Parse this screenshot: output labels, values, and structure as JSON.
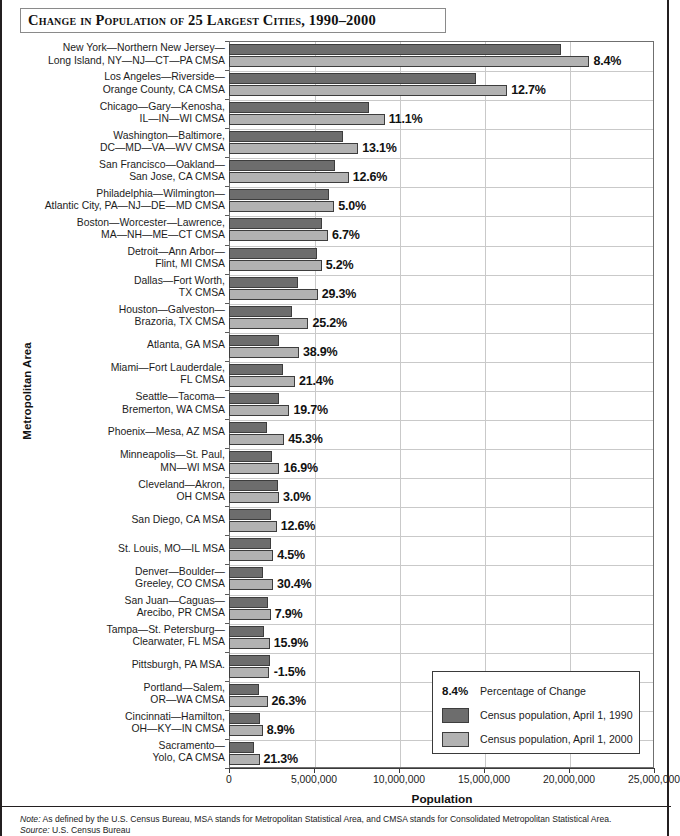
{
  "title": "Change in Population of 25 Largest Cities, 1990–2000",
  "axes": {
    "y_title": "Metropolitan Area",
    "x_title": "Population",
    "x_ticks": [
      "0",
      "5,000,000",
      "10,000,000",
      "15,000,000",
      "20,000,000",
      "25,000,000"
    ]
  },
  "legend": {
    "pct_key": "8.4%",
    "pct_label": "Percentage of Change",
    "series_1990": "Census population, April 1, 1990",
    "series_2000": "Census population, April 1, 2000"
  },
  "notes": {
    "note_prefix": "Note:",
    "note_text": " As defined by the U.S. Census Bureau, MSA stands for Metropolitan Statistical Area, and CMSA stands for Consolidated Metropolitan Statistical Area.",
    "source_prefix": "Source:",
    "source_text": " U.S. Census Bureau"
  },
  "colors": {
    "bar_1990": "#6d6d6d",
    "bar_2000": "#b2b2b2",
    "grid": "#c9c9c9",
    "frame": "#6f6f6f",
    "text": "#1c1c1c"
  },
  "chart_data": {
    "type": "bar",
    "title": "Change in Population of 25 Largest Cities, 1990–2000",
    "xlabel": "Population",
    "ylabel": "Metropolitan Area",
    "orientation": "horizontal",
    "grid": true,
    "legend_position": "inside-bottom-right",
    "xlim": [
      0,
      25000000
    ],
    "xticks": [
      0,
      5000000,
      10000000,
      15000000,
      20000000,
      25000000
    ],
    "categories": [
      "New York—Northern New Jersey—\nLong Island, NY—NJ—CT—PA CMSA",
      "Los Angeles—Riverside—\nOrange County, CA CMSA",
      "Chicago—Gary—Kenosha,\nIL—IN—WI CMSA",
      "Washington—Baltimore,\nDC—MD—VA—WV CMSA",
      "San Francisco—Oakland—\nSan Jose, CA CMSA",
      "Philadelphia—Wilmington—\nAtlantic City, PA—NJ—DE—MD CMSA",
      "Boston—Worcester—Lawrence,\nMA—NH—ME—CT CMSA",
      "Detroit—Ann Arbor—\nFlint, MI CMSA",
      "Dallas—Fort Worth,\nTX CMSA",
      "Houston—Galveston—\nBrazoria, TX CMSA",
      "Atlanta, GA MSA",
      "Miami—Fort Lauderdale,\nFL CMSA",
      "Seattle—Tacoma—\nBremerton, WA CMSA",
      "Phoenix—Mesa, AZ MSA",
      "Minneapolis—St. Paul,\nMN—WI MSA",
      "Cleveland—Akron,\nOH CMSA",
      "San Diego, CA MSA",
      "St. Louis, MO—IL MSA",
      "Denver—Boulder—\nGreeley, CO CMSA",
      "San Juan—Caguas—\nArecibo, PR CMSA",
      "Tampa—St. Petersburg—\nClearwater, FL MSA",
      "Pittsburgh, PA MSA.",
      "Portland—Salem,\nOR—WA CMSA",
      "Cincinnati—Hamilton,\nOH—KY—IN CMSA",
      "Sacramento—\nYolo, CA CMSA"
    ],
    "series": [
      {
        "name": "Census population, April 1, 1990",
        "color": "#6d6d6d",
        "values": [
          19549649,
          14531529,
          8239820,
          6727050,
          6253311,
          5892937,
          5455403,
          5187171,
          4037282,
          3731131,
          2959950,
          3192582,
          2970328,
          2238480,
          2538834,
          2859644,
          2498016,
          2492525,
          1980140,
          2270808,
          2067959,
          2394811,
          1793476,
          1817571,
          1481102
        ]
      },
      {
        "name": "Census population, April 1, 2000",
        "color": "#b2b2b2",
        "values": [
          21199865,
          16373645,
          9157540,
          7608070,
          7039362,
          6188463,
          5819100,
          5456428,
          5221801,
          4669571,
          4112198,
          3876380,
          3554760,
          3251876,
          2968806,
          2945831,
          2813833,
          2603607,
          2581506,
          2450292,
          2395997,
          2358695,
          2265223,
          1979202,
          1796857
        ]
      }
    ],
    "percentage_change_labels": [
      "8.4%",
      "12.7%",
      "11.1%",
      "13.1%",
      "12.6%",
      "5.0%",
      "6.7%",
      "5.2%",
      "29.3%",
      "25.2%",
      "38.9%",
      "21.4%",
      "19.7%",
      "45.3%",
      "16.9%",
      "3.0%",
      "12.6%",
      "4.5%",
      "30.4%",
      "7.9%",
      "15.9%",
      "-1.5%",
      "26.3%",
      "8.9%",
      "21.3%"
    ]
  }
}
